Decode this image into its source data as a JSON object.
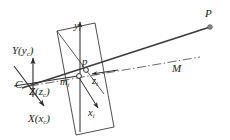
{
  "figure": {
    "type": "camera-projection-geometry",
    "background_color": "#ffffff",
    "line_color": "#2b2b2b",
    "label_color": "#1a1a1a"
  },
  "labels": {
    "camera_center": "C",
    "camera_axis_y": "Y(y",
    "camera_axis_y_sub": "c",
    "camera_axis_y_close": ")",
    "camera_axis_z": "Z(z",
    "camera_axis_z_sub": "c",
    "camera_axis_z_close": ")",
    "camera_axis_x": "X(x",
    "camera_axis_x_sub": "c",
    "camera_axis_x_close": ")",
    "image_axis_y": "y",
    "image_axis_y_sub": "i",
    "image_axis_x": "x",
    "image_axis_x_sub": "i",
    "image_axis_z": "z",
    "image_axis_z_sub": "i",
    "image_origin": "m",
    "image_origin_sub": "i",
    "image_point": "p",
    "world_point": "P",
    "optical_axis": "M"
  },
  "geometry": {
    "camera_center_point": [
      33,
      85
    ],
    "image_origin_point": [
      78,
      76
    ],
    "image_point_p": [
      86,
      70
    ],
    "world_point_P": [
      210,
      27
    ],
    "image_plane_corners": [
      [
        57,
        31
      ],
      [
        95,
        23
      ],
      [
        114,
        127
      ],
      [
        76,
        135
      ]
    ],
    "optical_axis_dash_pattern": "dash-dot",
    "ray_from_C_to_P": true
  }
}
